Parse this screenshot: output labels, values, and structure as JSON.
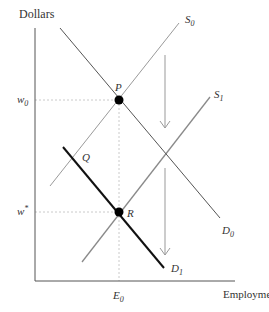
{
  "diagram": {
    "type": "labor-market supply-demand shift",
    "axes": {
      "y_label": "Dollars",
      "x_label": "Employment"
    },
    "y_ticks": [
      {
        "label": "w",
        "sub": "0",
        "y": 100
      },
      {
        "label": "w",
        "sup": "*",
        "y": 212
      }
    ],
    "x_ticks": [
      {
        "label": "E",
        "sub": "0",
        "x": 119
      }
    ],
    "curves": [
      {
        "id": "D0",
        "label": "D",
        "sub": "0",
        "type": "demand",
        "x1": 60,
        "y1": 28,
        "x2": 220,
        "y2": 218,
        "color": "#555555",
        "width": 1
      },
      {
        "id": "S0",
        "label": "S",
        "sub": "0",
        "type": "supply",
        "x1": 50,
        "y1": 186,
        "x2": 179,
        "y2": 23,
        "color": "#999999",
        "width": 1
      },
      {
        "id": "S1",
        "label": "S",
        "sub": "1",
        "type": "supply",
        "x1": 82,
        "y1": 262,
        "x2": 210,
        "y2": 97,
        "color": "#888888",
        "width": 1.3
      },
      {
        "id": "D1",
        "label": "D",
        "sub": "1",
        "type": "demand",
        "x1": 63,
        "y1": 147,
        "x2": 164,
        "y2": 268,
        "color": "#111111",
        "width": 2
      }
    ],
    "points": [
      {
        "id": "P",
        "label": "P",
        "x": 119,
        "y": 100,
        "marked": true
      },
      {
        "id": "R",
        "label": "R",
        "x": 119,
        "y": 212,
        "marked": true
      },
      {
        "id": "Q",
        "label": "Q",
        "x": 75,
        "y": 162,
        "marked": false
      }
    ],
    "arrows": [
      {
        "direction": "down",
        "x": 165,
        "y1": 55,
        "y2": 128
      },
      {
        "direction": "down",
        "x": 165,
        "y1": 168,
        "y2": 255
      }
    ],
    "colors": {
      "axis": "#555555",
      "dashed": "#bbbbbb",
      "arrow": "#999999",
      "point": "#000000",
      "text": "#333333"
    }
  }
}
